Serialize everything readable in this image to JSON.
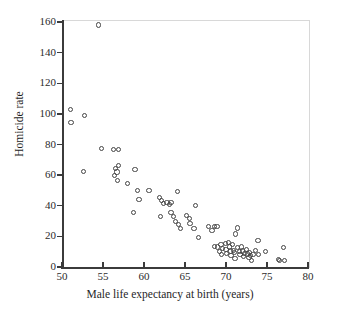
{
  "chart_data": {
    "type": "scatter",
    "title": "",
    "xlabel": "Male life expectancy at birth (years)",
    "ylabel": "Homicide rate",
    "xlim": [
      50,
      80
    ],
    "ylim": [
      0,
      160
    ],
    "xticks": [
      50,
      55,
      60,
      65,
      70,
      75,
      80
    ],
    "yticks": [
      0,
      20,
      40,
      60,
      80,
      100,
      120,
      140,
      160
    ],
    "grid": false,
    "legend": null,
    "marker": "open-circle",
    "series": [
      {
        "name": "countries",
        "points": [
          [
            51.0,
            103.0
          ],
          [
            51.1,
            94.5
          ],
          [
            52.7,
            99.0
          ],
          [
            52.6,
            62.5
          ],
          [
            54.5,
            158.0
          ],
          [
            54.8,
            77.5
          ],
          [
            56.3,
            76.5
          ],
          [
            56.9,
            76.5
          ],
          [
            56.5,
            64.5
          ],
          [
            56.4,
            60.0
          ],
          [
            56.9,
            66.5
          ],
          [
            56.7,
            62.0
          ],
          [
            56.8,
            56.5
          ],
          [
            58.0,
            54.5
          ],
          [
            58.9,
            63.5
          ],
          [
            58.7,
            35.5
          ],
          [
            59.4,
            44.0
          ],
          [
            59.2,
            50.0
          ],
          [
            60.6,
            50.0
          ],
          [
            61.9,
            45.5
          ],
          [
            62.1,
            43.5
          ],
          [
            62.0,
            33.0
          ],
          [
            62.4,
            41.5
          ],
          [
            62.8,
            42.0
          ],
          [
            63.1,
            41.0
          ],
          [
            63.3,
            42.0
          ],
          [
            63.3,
            35.5
          ],
          [
            63.6,
            33.0
          ],
          [
            63.8,
            29.5
          ],
          [
            64.1,
            49.5
          ],
          [
            64.2,
            27.5
          ],
          [
            64.5,
            25.0
          ],
          [
            65.2,
            33.5
          ],
          [
            65.5,
            31.5
          ],
          [
            65.6,
            28.5
          ],
          [
            66.1,
            25.0
          ],
          [
            66.3,
            40.0
          ],
          [
            66.6,
            19.0
          ],
          [
            67.9,
            26.5
          ],
          [
            68.3,
            24.0
          ],
          [
            68.6,
            26.5
          ],
          [
            68.9,
            26.5
          ],
          [
            68.6,
            13.5
          ],
          [
            69.0,
            13.0
          ],
          [
            69.2,
            10.0
          ],
          [
            69.4,
            14.5
          ],
          [
            69.6,
            12.0
          ],
          [
            69.5,
            8.0
          ],
          [
            69.9,
            15.5
          ],
          [
            70.0,
            11.5
          ],
          [
            70.1,
            9.0
          ],
          [
            70.3,
            16.0
          ],
          [
            70.4,
            13.0
          ],
          [
            70.5,
            10.5
          ],
          [
            70.6,
            7.5
          ],
          [
            70.8,
            14.5
          ],
          [
            70.9,
            11.0
          ],
          [
            71.0,
            9.5
          ],
          [
            71.1,
            5.5
          ],
          [
            71.2,
            21.5
          ],
          [
            71.4,
            25.5
          ],
          [
            71.4,
            12.5
          ],
          [
            71.6,
            10.0
          ],
          [
            71.7,
            8.0
          ],
          [
            71.9,
            13.0
          ],
          [
            72.0,
            10.5
          ],
          [
            72.1,
            7.0
          ],
          [
            72.3,
            9.0
          ],
          [
            72.5,
            11.5
          ],
          [
            72.6,
            8.5
          ],
          [
            72.8,
            6.0
          ],
          [
            72.9,
            9.5
          ],
          [
            73.0,
            7.5
          ],
          [
            73.1,
            4.0
          ],
          [
            73.3,
            8.0
          ],
          [
            73.6,
            11.0
          ],
          [
            73.9,
            17.5
          ],
          [
            74.0,
            8.0
          ],
          [
            74.8,
            10.0
          ],
          [
            76.4,
            5.0
          ],
          [
            76.5,
            4.0
          ],
          [
            77.0,
            12.5
          ],
          [
            77.1,
            4.5
          ]
        ]
      }
    ]
  },
  "axis": {
    "x_tick_labels": [
      "50",
      "55",
      "60",
      "65",
      "70",
      "75",
      "80"
    ],
    "y_tick_labels": [
      "0",
      "20",
      "40",
      "60",
      "80",
      "100",
      "120",
      "140",
      "160"
    ]
  }
}
